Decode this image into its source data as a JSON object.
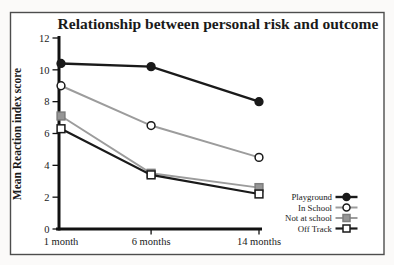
{
  "figure": {
    "background": "#fbfaf9",
    "inner_background": "#ffffff",
    "border_color": "#4d4d4d"
  },
  "chart_data": {
    "type": "line",
    "title": "Relationship between personal risk and outcome",
    "xlabel": "",
    "ylabel": "Mean Reaction index score",
    "categories": [
      "1 month",
      "6 months",
      "14 months"
    ],
    "x_positions_frac": [
      0,
      0.455,
      1
    ],
    "ylim": [
      0,
      12
    ],
    "yticks": [
      0,
      2,
      4,
      6,
      8,
      10,
      12
    ],
    "grid": false,
    "legend_position": "lower-right",
    "axis_color": "#111111",
    "text_color": "#1a1a1a",
    "series": [
      {
        "name": "Playground",
        "values": [
          10.4,
          10.2,
          8.0
        ],
        "line_color": "#1a1a1a",
        "line_width": 2.4,
        "marker": "circle-filled",
        "marker_fill": "#1a1a1a",
        "marker_stroke": "#1a1a1a"
      },
      {
        "name": "In School",
        "values": [
          9.0,
          6.5,
          4.5
        ],
        "line_color": "#9c9c9c",
        "line_width": 2.0,
        "marker": "circle-open",
        "marker_fill": "#ffffff",
        "marker_stroke": "#1a1a1a"
      },
      {
        "name": "Not at school",
        "values": [
          7.1,
          3.5,
          2.6
        ],
        "line_color": "#9c9c9c",
        "line_width": 2.0,
        "marker": "square-filled",
        "marker_fill": "#969696",
        "marker_stroke": "#7d7d7d"
      },
      {
        "name": "Off Track",
        "values": [
          6.3,
          3.4,
          2.2
        ],
        "line_color": "#1a1a1a",
        "line_width": 2.2,
        "marker": "square-open",
        "marker_fill": "#ffffff",
        "marker_stroke": "#1a1a1a"
      }
    ]
  }
}
